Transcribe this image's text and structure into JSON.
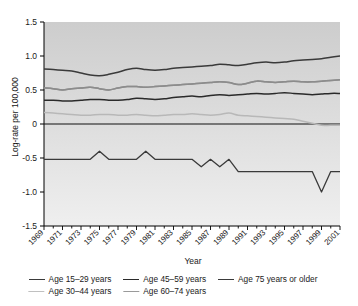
{
  "chart_data": {
    "type": "line",
    "title": "",
    "xlabel": "Year",
    "ylabel": "Log-rate per 100,000",
    "xlim": [
      1969,
      2001
    ],
    "ylim": [
      -1.5,
      1.5
    ],
    "yticks": [
      "1.5",
      "1.0",
      "0.5",
      "0",
      "-0.5",
      "-1.0",
      "-1.5"
    ],
    "ytick_values": [
      1.5,
      1.0,
      0.5,
      0,
      -0.5,
      -1.0,
      -1.5
    ],
    "xticks": [
      "1969",
      "1971",
      "1973",
      "1975",
      "1977",
      "1979",
      "1981",
      "1983",
      "1985",
      "1987",
      "1989",
      "1991",
      "1993",
      "1995",
      "1997",
      "1999",
      "2001"
    ],
    "xtick_values": [
      1969,
      1971,
      1973,
      1975,
      1977,
      1979,
      1981,
      1983,
      1985,
      1987,
      1989,
      1991,
      1993,
      1995,
      1997,
      1999,
      2001
    ],
    "grid": false,
    "legend_position": "bottom",
    "x": [
      1969,
      1970,
      1971,
      1972,
      1973,
      1974,
      1975,
      1976,
      1977,
      1978,
      1979,
      1980,
      1981,
      1982,
      1983,
      1984,
      1985,
      1986,
      1987,
      1988,
      1989,
      1990,
      1991,
      1992,
      1993,
      1994,
      1995,
      1996,
      1997,
      1998,
      1999,
      2000,
      2001
    ],
    "series": [
      {
        "name": "Age 15–29 years",
        "color": "#b8b8b8",
        "values": [
          0.17,
          0.16,
          0.15,
          0.14,
          0.13,
          0.13,
          0.14,
          0.14,
          0.13,
          0.13,
          0.14,
          0.13,
          0.12,
          0.13,
          0.14,
          0.14,
          0.15,
          0.14,
          0.13,
          0.14,
          0.16,
          0.13,
          0.12,
          0.11,
          0.1,
          0.09,
          0.08,
          0.07,
          0.04,
          0.01,
          -0.02,
          -0.02,
          -0.02
        ]
      },
      {
        "name": "Age 30–44 years",
        "color": "#8c8c8c",
        "values": [
          0.53,
          0.52,
          0.5,
          0.52,
          0.53,
          0.54,
          0.52,
          0.5,
          0.53,
          0.55,
          0.55,
          0.54,
          0.55,
          0.56,
          0.57,
          0.58,
          0.59,
          0.6,
          0.61,
          0.62,
          0.61,
          0.58,
          0.6,
          0.63,
          0.62,
          0.61,
          0.62,
          0.63,
          0.62,
          0.62,
          0.63,
          0.64,
          0.65
        ]
      },
      {
        "name": "Age 45–59 years",
        "color": "#2a2a2a",
        "values": [
          0.35,
          0.35,
          0.34,
          0.34,
          0.35,
          0.36,
          0.36,
          0.35,
          0.35,
          0.36,
          0.38,
          0.37,
          0.36,
          0.37,
          0.39,
          0.4,
          0.41,
          0.4,
          0.42,
          0.43,
          0.42,
          0.43,
          0.44,
          0.45,
          0.44,
          0.45,
          0.46,
          0.45,
          0.44,
          0.43,
          0.44,
          0.45,
          0.45
        ]
      },
      {
        "name": "Age 60–74 years",
        "color": "#8c8c8c",
        "values": [
          0.53,
          0.52,
          0.5,
          0.52,
          0.53,
          0.54,
          0.52,
          0.5,
          0.53,
          0.55,
          0.55,
          0.54,
          0.55,
          0.56,
          0.57,
          0.58,
          0.59,
          0.6,
          0.61,
          0.62,
          0.61,
          0.58,
          0.6,
          0.63,
          0.62,
          0.61,
          0.62,
          0.63,
          0.62,
          0.62,
          0.63,
          0.64,
          0.65
        ]
      },
      {
        "name": "Age 75 years or older",
        "color": "#3a3a3a",
        "values": [
          0.81,
          0.8,
          0.79,
          0.78,
          0.75,
          0.72,
          0.71,
          0.73,
          0.76,
          0.8,
          0.82,
          0.8,
          0.79,
          0.8,
          0.82,
          0.83,
          0.84,
          0.85,
          0.86,
          0.88,
          0.87,
          0.86,
          0.88,
          0.9,
          0.91,
          0.9,
          0.91,
          0.93,
          0.94,
          0.95,
          0.96,
          0.98,
          1.0
        ]
      },
      {
        "name": "lower-step-series",
        "color": "#3a3a3a",
        "values": [
          -0.52,
          -0.52,
          -0.52,
          -0.52,
          -0.52,
          -0.52,
          -0.4,
          -0.52,
          -0.52,
          -0.52,
          -0.52,
          -0.4,
          -0.52,
          -0.52,
          -0.52,
          -0.52,
          -0.52,
          -0.63,
          -0.52,
          -0.63,
          -0.52,
          -0.7,
          -0.7,
          -0.7,
          -0.7,
          -0.7,
          -0.7,
          -0.7,
          -0.7,
          -0.7,
          -1.0,
          -0.7,
          -0.7
        ]
      }
    ]
  },
  "axes": {
    "ylabel": "Log-rate per 100,000",
    "xlabel": "Year"
  },
  "legend": {
    "rows": [
      [
        {
          "label": "Age 15–29 years",
          "color": "#3a3a3a"
        },
        {
          "label": "Age 45–59 years",
          "color": "#2a2a2a"
        },
        {
          "label": "Age 75 years or older",
          "color": "#3a3a3a"
        }
      ],
      [
        {
          "label": "Age 30–44 years",
          "color": "#c0c0c0"
        },
        {
          "label": "Age 60–74 years",
          "color": "#9a9a9a"
        }
      ]
    ]
  },
  "colors": {
    "plot_background_top": "#cfcfcf",
    "plot_background_bottom": "#ececec",
    "axis": "#000000",
    "text": "#1a1a1a"
  }
}
